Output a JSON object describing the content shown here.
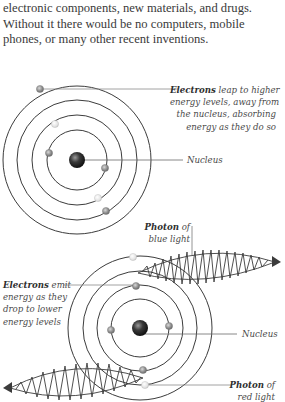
{
  "intro_text": {
    "lines": [
      "electronic components, new materials, and drugs.",
      "Without it there would be no computers, mobile",
      "phones, or many other recent inventions."
    ]
  },
  "diagram_absorption": {
    "electrons_label": {
      "bold": "Electrons",
      "rest_lines": [
        "leap to higher",
        "energy levels, away from",
        "the nucleus, absorbing",
        "energy as they do so"
      ]
    },
    "nucleus_label": "Nucleus"
  },
  "diagram_emission": {
    "photon_blue_label": {
      "bold": "Photon",
      "rest_line1": "of",
      "line2": "blue light"
    },
    "electrons_label": {
      "bold": "Electrons",
      "rest_line1": "emit",
      "lines": [
        "energy as they",
        "drop to lower",
        "energy levels"
      ]
    },
    "nucleus_label": "Nucleus",
    "photon_red_label": {
      "bold": "Photon",
      "rest_line1": "of",
      "line2": "red light"
    }
  },
  "colors": {
    "text": "#3a3a3a",
    "ring": "#3c3c3c",
    "leader_line": "#8a8a8a",
    "nucleus": "#2a2a2a",
    "electron_dark": "#8c8c8c",
    "electron_light": "#e2e2e2"
  }
}
